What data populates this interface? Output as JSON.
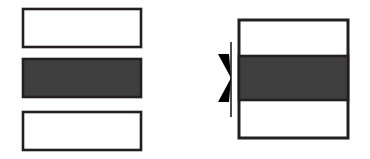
{
  "figure": {
    "type": "technical-line-drawing",
    "caption": "",
    "background_color": "#ffffff",
    "outline_color": "#231f20",
    "fill_color": "#3f3f3f",
    "annotation_line_color": "#4d4d4d",
    "canvas": {
      "width": 370,
      "height": 159
    },
    "groups": [
      {
        "name": "exploded-stack",
        "label": "",
        "layers": [
          {
            "name": "top-layer",
            "label": "",
            "fill": "none",
            "stroke": "#231f20",
            "stroke_width": 2.6,
            "x": 23,
            "y": 9,
            "width": 118,
            "height": 38
          },
          {
            "name": "middle-layer",
            "label": "",
            "fill": "#3f3f3f",
            "stroke": "#231f20",
            "stroke_width": 2.6,
            "x": 23,
            "y": 59,
            "width": 118,
            "height": 38
          },
          {
            "name": "bottom-layer",
            "label": "",
            "fill": "none",
            "stroke": "#231f20",
            "stroke_width": 2.6,
            "x": 23,
            "y": 112,
            "width": 118,
            "height": 38
          }
        ]
      },
      {
        "name": "assembled-stack",
        "label": "",
        "outline": {
          "name": "assembly-outline",
          "fill": "none",
          "stroke": "#231f20",
          "stroke_width": 3,
          "x": 239,
          "y": 20,
          "width": 109,
          "height": 118
        },
        "band": {
          "name": "highlighted-band",
          "label": "",
          "fill": "#3f3f3f",
          "stroke": "#231f20",
          "stroke_width": 2.6,
          "x": 239,
          "y": 56,
          "width": 109,
          "height": 44
        }
      }
    ],
    "annotation": {
      "name": "dimension-marker",
      "label": "",
      "extension_line": {
        "x": 231,
        "y_top": 42,
        "y_bottom": 117,
        "stroke_width": 2,
        "color": "#4d4d4d"
      },
      "arrow_upper": {
        "points": "218,54 231,78 229,54",
        "direction": "down",
        "color": "#000000"
      },
      "arrow_lower": {
        "points": "218,102 231,78 229,102",
        "direction": "up",
        "color": "#000000"
      }
    }
  }
}
